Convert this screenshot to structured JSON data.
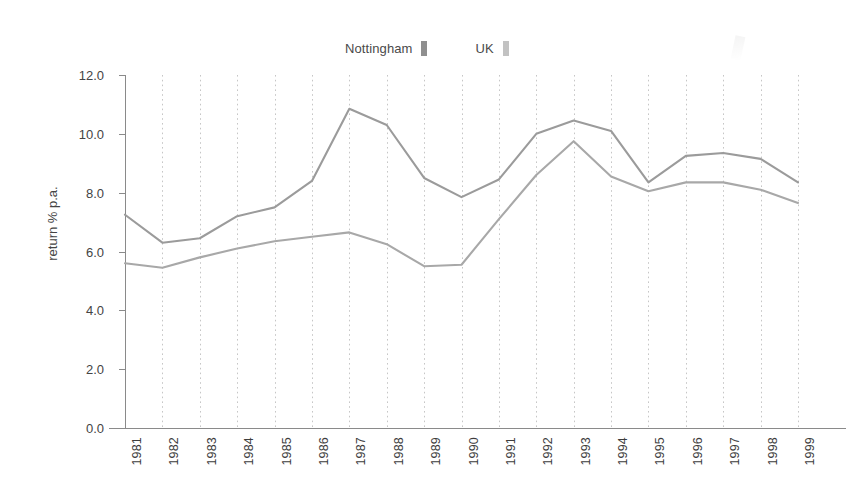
{
  "legend": {
    "entries": [
      {
        "label": "Nottingham",
        "color": "#8f8f8f",
        "swatch_name": "legend-swatch-nottingham"
      },
      {
        "label": "UK",
        "color": "#c2c2c2",
        "swatch_name": "legend-swatch-uk"
      }
    ]
  },
  "axes": {
    "y_title": "return % p.a.",
    "x_title": "",
    "y_ticks": [
      "0.0",
      "2.0",
      "4.0",
      "6.0",
      "8.0",
      "10.0",
      "12.0"
    ],
    "x_ticks": [
      "1981",
      "1982",
      "1983",
      "1984",
      "1985",
      "1986",
      "1987",
      "1988",
      "1989",
      "1990",
      "1991",
      "1992",
      "1993",
      "1994",
      "1995",
      "1996",
      "1997",
      "1998",
      "1999"
    ]
  },
  "chart_data": {
    "type": "line",
    "title": "",
    "subtitle": "",
    "xlabel": "",
    "ylabel": "return % p.a.",
    "ylim": [
      0.0,
      12.0
    ],
    "ytick_step": 2.0,
    "grid": "vertical-dashed",
    "legend_position": "top-center",
    "x": [
      "1981",
      "1982",
      "1983",
      "1984",
      "1985",
      "1986",
      "1987",
      "1988",
      "1989",
      "1990",
      "1991",
      "1992",
      "1993",
      "1994",
      "1995",
      "1996",
      "1997",
      "1998",
      "1999"
    ],
    "series": [
      {
        "name": "Nottingham",
        "color": "#9b9b9b",
        "values": [
          7.25,
          6.3,
          6.45,
          7.2,
          7.5,
          8.4,
          10.85,
          10.3,
          8.5,
          7.85,
          8.45,
          10.0,
          10.45,
          10.1,
          8.35,
          9.25,
          9.35,
          9.15,
          8.35
        ]
      },
      {
        "name": "UK",
        "color": "#a8a8a8",
        "values": [
          5.6,
          5.45,
          5.8,
          6.1,
          6.35,
          6.5,
          6.65,
          6.25,
          5.5,
          5.55,
          7.1,
          8.6,
          9.75,
          8.55,
          8.05,
          8.35,
          8.35,
          8.1,
          7.65
        ]
      }
    ]
  },
  "layout": {
    "plot_left": 125,
    "plot_right": 798,
    "plot_top": 75,
    "plot_bottom": 428,
    "axis_color": "#8a8a8a",
    "grid_color": "#bfbfbf",
    "background": "#ffffff"
  }
}
